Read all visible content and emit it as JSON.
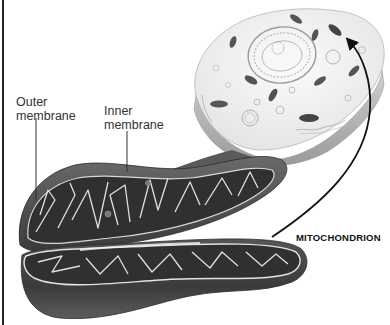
{
  "diagram": {
    "labels": {
      "outer_membrane": "Outer\nmembrane",
      "outer_membrane_line1": "Outer",
      "outer_membrane_line2": "membrane",
      "inner_membrane_line1": "Inner",
      "inner_membrane_line2": "membrane",
      "organelle": "MITOCHONDRION"
    },
    "elements": [
      {
        "name": "cell",
        "description": "cutaway animal cell with nucleus and organelles"
      },
      {
        "name": "mitochondrion",
        "description": "cutaway mitochondrion showing cristae in two halves"
      },
      {
        "name": "arrow",
        "description": "curved arrow from MITOCHONDRION label to a mitochondrion in the cell"
      }
    ],
    "colors": {
      "mito_outer": "#4a4a4a",
      "mito_inner": "#2e2e2e",
      "cristae_line": "#e6e6e6",
      "cell_fill": "#f2f2f2",
      "cell_edge": "#bdbdbd",
      "text": "#333333"
    }
  }
}
